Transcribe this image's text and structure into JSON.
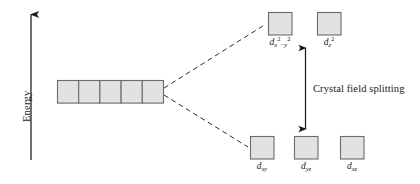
{
  "figure": {
    "type": "crystal-field-splitting-diagram",
    "background_color": "#ffffff",
    "line_color": "#1a1a1a",
    "box_fill_color": "#e2e2e2",
    "box_stroke_color": "#6b6b6b"
  },
  "axis": {
    "label": "Energy",
    "orientation": "vertical",
    "arrow_direction": "up"
  },
  "annotation": {
    "splitting_label": "Crystal field splitting",
    "arrow_style": "double-headed-vertical"
  },
  "levels": {
    "degenerate": {
      "name": "degenerate-d-orbitals",
      "box_count": 5,
      "boxes": [
        {
          "label": ""
        },
        {
          "label": ""
        },
        {
          "label": ""
        },
        {
          "label": ""
        },
        {
          "label": ""
        }
      ]
    },
    "upper": {
      "name": "eg-set",
      "boxes": [
        {
          "id": "dx2y2",
          "base": "d",
          "sub_x": "x",
          "sup_x": "2",
          "minus": "−",
          "sub_y": "y",
          "sup_y": "2"
        },
        {
          "id": "dz2",
          "base": "d",
          "sub_z": "z",
          "sup_z": "2"
        }
      ]
    },
    "lower": {
      "name": "t2g-set",
      "boxes": [
        {
          "id": "dxy",
          "base": "d",
          "sub": "xy"
        },
        {
          "id": "dyz",
          "base": "d",
          "sub": "yz"
        },
        {
          "id": "dxz",
          "base": "d",
          "sub": "xz"
        }
      ]
    }
  }
}
